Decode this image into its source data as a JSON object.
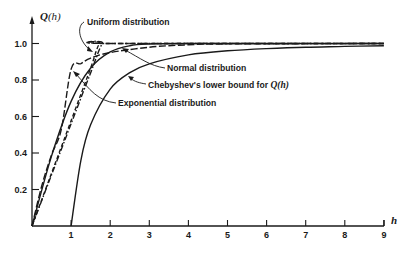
{
  "chart_data": {
    "type": "line",
    "title": "",
    "xlabel": "h",
    "ylabel": "Q(h)",
    "xlim": [
      0,
      9
    ],
    "ylim": [
      0,
      1.08
    ],
    "xticks": [
      "1",
      "2",
      "3",
      "4",
      "5",
      "6",
      "7",
      "8",
      "9"
    ],
    "yticks": [
      "0.2",
      "0.4",
      "0.6",
      "0.8",
      "1.0"
    ],
    "grid": false,
    "legend": "none (curves labeled by leader-line annotations)",
    "series": [
      {
        "name": "Uniform distribution",
        "style": "dashed",
        "x": [
          0,
          0.5,
          1.0,
          1.5,
          1.732,
          2.0,
          9.0
        ],
        "y": [
          0,
          0.289,
          0.577,
          0.866,
          1.0,
          1.0,
          1.0
        ]
      },
      {
        "name": "Exponential distribution",
        "style": "long-dash",
        "x": [
          0,
          0.25,
          0.5,
          0.75,
          1.0,
          1.25,
          1.5,
          2.0,
          3.0,
          4.0,
          5.0,
          9.0
        ],
        "y": [
          0,
          0.22,
          0.39,
          0.53,
          0.86,
          0.89,
          0.92,
          0.95,
          0.98,
          0.993,
          0.998,
          1.0
        ]
      },
      {
        "name": "Normal distribution",
        "style": "solid",
        "x": [
          0,
          0.5,
          1.0,
          1.5,
          2.0,
          2.5,
          3.0,
          4.0,
          9.0
        ],
        "y": [
          0,
          0.383,
          0.683,
          0.866,
          0.954,
          0.988,
          0.997,
          1.0,
          1.0
        ]
      },
      {
        "name": "Chebyshev's lower bound for Q(h)",
        "style": "solid",
        "x": [
          1,
          1.25,
          1.5,
          2.0,
          2.5,
          3.0,
          4.0,
          5.0,
          6.0,
          7.0,
          8.0,
          9.0
        ],
        "y": [
          0,
          0.36,
          0.556,
          0.75,
          0.84,
          0.889,
          0.9375,
          0.96,
          0.972,
          0.98,
          0.984,
          0.988
        ]
      },
      {
        "name": "Dash-dot curve (unlabeled)",
        "style": "dash-dot",
        "x": [
          0,
          0.5,
          1.0,
          1.5,
          1.8,
          2.0,
          9.0
        ],
        "y": [
          0,
          0.28,
          0.56,
          0.84,
          1.0,
          1.0,
          1.0
        ]
      }
    ],
    "annotations": [
      {
        "text": "Uniform distribution",
        "points_to": "Uniform distribution"
      },
      {
        "text": "Normal distribution",
        "points_to": "Normal distribution"
      },
      {
        "text": "Chebyshev's lower bound for Q(h)",
        "points_to": "Chebyshev's lower bound for Q(h)"
      },
      {
        "text": "Exponential distribution",
        "points_to": "Exponential distribution"
      }
    ]
  },
  "labels": {
    "y_axis_title_q": "Q",
    "y_axis_title_rest": "(h)",
    "x_axis_title": "h",
    "uniform": "Uniform distribution",
    "normal": "Normal distribution",
    "chebyshev_prefix": "Chebyshev's lower bound for ",
    "chebyshev_suffix": "Q(h)",
    "exponential": "Exponential distribution"
  },
  "colors": {
    "ink": "#1a1a1a",
    "background": "#ffffff"
  }
}
